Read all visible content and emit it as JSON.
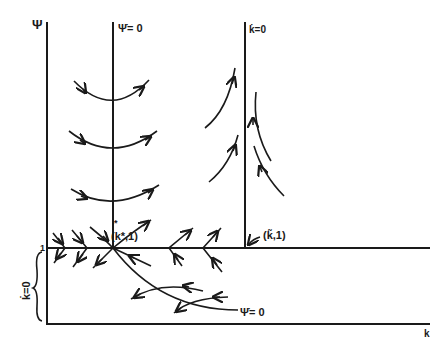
{
  "diagram": {
    "type": "phase-diagram",
    "axes": {
      "y_label": "Ψ",
      "x_label": "k"
    },
    "loci": {
      "psi_dot_zero_vertical": "Ψ̇= 0",
      "k_dot_zero_vertical": "k̇=0",
      "psi_dot_zero_curve": "Ψ̇= 0",
      "k_dot_zero_brace": "k̇=0"
    },
    "points": {
      "steady_state": "(k*,1)",
      "steady_state_k": "k",
      "steady_state_star": "*",
      "steady_state_rest": ",1)",
      "open_paren": "(",
      "tilde_point": "(k̃,1)",
      "tilde_k": "k",
      "tilde_mark": "~"
    },
    "tick_labels": {
      "psi_one": "1"
    },
    "colors": {
      "ink": "#1a1a1a",
      "background": "#ffffff"
    }
  }
}
